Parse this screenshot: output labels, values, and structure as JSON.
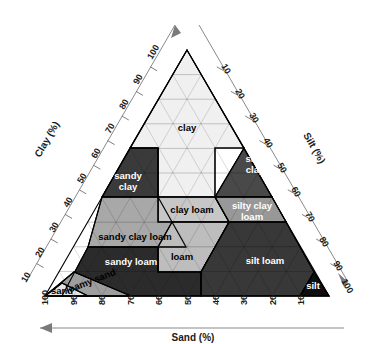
{
  "figure": {
    "type": "ternary-diagram",
    "background": "#ffffff"
  },
  "axes": {
    "left": {
      "label": "Clay (%)",
      "ticks": [
        "100",
        "90",
        "80",
        "70",
        "60",
        "50",
        "40",
        "30",
        "20",
        "10"
      ],
      "arrow": "up"
    },
    "right": {
      "label": "Silt (%)",
      "ticks": [
        "10",
        "20",
        "30",
        "40",
        "50",
        "60",
        "70",
        "80",
        "90",
        "100"
      ],
      "arrow": "down-right"
    },
    "bottom": {
      "label": "Sand (%)",
      "ticks": [
        "100",
        "90",
        "80",
        "70",
        "60",
        "50",
        "40",
        "30",
        "20",
        "10"
      ],
      "arrow": "left"
    }
  },
  "regions": [
    {
      "key": "clay",
      "label": "clay",
      "fill": "#f0f0f0",
      "text": "dark"
    },
    {
      "key": "silty-clay",
      "label": "silty clay",
      "fill": "#4a4a4a",
      "text": "light"
    },
    {
      "key": "sandy-clay",
      "label": "sandy clay",
      "fill": "#3c3c3c",
      "text": "light"
    },
    {
      "key": "clay-loam",
      "label": "clay loam",
      "fill": "#c9c9c9",
      "text": "dark"
    },
    {
      "key": "silty-clay-loam",
      "label": "silty clay loam",
      "fill": "#9a9a9a",
      "text": "light"
    },
    {
      "key": "sandy-clay-loam",
      "label": "sandy clay loam",
      "fill": "#a8a8a8",
      "text": "dark"
    },
    {
      "key": "loam",
      "label": "loam",
      "fill": "#bdbdbd",
      "text": "dark"
    },
    {
      "key": "silt-loam",
      "label": "silt loam",
      "fill": "#3a3a3a",
      "text": "light"
    },
    {
      "key": "sandy-loam",
      "label": "sandy loam",
      "fill": "#2e2e2e",
      "text": "light"
    },
    {
      "key": "silt",
      "label": "silt",
      "fill": "#101010",
      "text": "light"
    },
    {
      "key": "loamy-sand",
      "label": "loamy sand",
      "fill": "#9e9e9e",
      "text": "dark"
    },
    {
      "key": "sand",
      "label": "sand",
      "fill": "#e6e6e6",
      "text": "dark"
    }
  ],
  "chart_data": {
    "type": "ternary",
    "components": [
      "Sand (%)",
      "Silt (%)",
      "Clay (%)"
    ],
    "classes": [
      {
        "name": "clay",
        "clay": [
          40,
          100
        ],
        "silt": [
          0,
          60
        ],
        "sand": [
          0,
          45
        ]
      },
      {
        "name": "silty clay",
        "clay": [
          40,
          60
        ],
        "silt": [
          40,
          60
        ],
        "sand": [
          0,
          20
        ]
      },
      {
        "name": "sandy clay",
        "clay": [
          35,
          55
        ],
        "silt": [
          0,
          20
        ],
        "sand": [
          45,
          65
        ]
      },
      {
        "name": "clay loam",
        "clay": [
          27,
          40
        ],
        "silt": [
          15,
          53
        ],
        "sand": [
          20,
          45
        ]
      },
      {
        "name": "silty clay loam",
        "clay": [
          27,
          40
        ],
        "silt": [
          40,
          73
        ],
        "sand": [
          0,
          20
        ]
      },
      {
        "name": "sandy clay loam",
        "clay": [
          20,
          35
        ],
        "silt": [
          0,
          28
        ],
        "sand": [
          45,
          80
        ]
      },
      {
        "name": "loam",
        "clay": [
          7,
          27
        ],
        "silt": [
          28,
          50
        ],
        "sand": [
          23,
          52
        ]
      },
      {
        "name": "silt loam",
        "clay": [
          0,
          27
        ],
        "silt": [
          50,
          88
        ],
        "sand": [
          0,
          50
        ]
      },
      {
        "name": "sandy loam",
        "clay": [
          0,
          20
        ],
        "silt": [
          0,
          50
        ],
        "sand": [
          43,
          85
        ]
      },
      {
        "name": "silt",
        "clay": [
          0,
          12
        ],
        "silt": [
          80,
          100
        ],
        "sand": [
          0,
          20
        ]
      },
      {
        "name": "loamy sand",
        "clay": [
          0,
          15
        ],
        "silt": [
          0,
          30
        ],
        "sand": [
          70,
          90
        ]
      },
      {
        "name": "sand",
        "clay": [
          0,
          10
        ],
        "silt": [
          0,
          15
        ],
        "sand": [
          85,
          100
        ]
      }
    ],
    "gridlines": true,
    "grid_step": 10
  }
}
